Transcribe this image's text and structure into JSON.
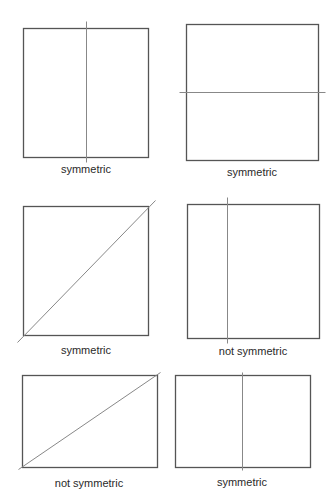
{
  "figures": [
    {
      "id": "fig-1",
      "shape": "square",
      "rect": {
        "x": 23,
        "y": 28,
        "w": 125,
        "h": 129
      },
      "line": {
        "type": "vertical",
        "x1": 86,
        "y1": 21,
        "x2": 86,
        "y2": 162
      },
      "label": "symmetric",
      "label_pos": {
        "x": 86,
        "y": 163
      }
    },
    {
      "id": "fig-2",
      "shape": "square",
      "rect": {
        "x": 186,
        "y": 24,
        "w": 132,
        "h": 136
      },
      "line": {
        "type": "horizontal",
        "x1": 179,
        "y1": 92,
        "x2": 325,
        "y2": 92
      },
      "label": "symmetric",
      "label_pos": {
        "x": 252,
        "y": 166
      }
    },
    {
      "id": "fig-3",
      "shape": "square",
      "rect": {
        "x": 23,
        "y": 206,
        "w": 125,
        "h": 129
      },
      "line": {
        "type": "diagonal",
        "x1": 17,
        "y1": 342,
        "x2": 155,
        "y2": 200
      },
      "label": "symmetric",
      "label_pos": {
        "x": 86,
        "y": 344
      }
    },
    {
      "id": "fig-4",
      "shape": "square",
      "rect": {
        "x": 187,
        "y": 204,
        "w": 132,
        "h": 134
      },
      "line": {
        "type": "vertical",
        "x1": 227,
        "y1": 197,
        "x2": 227,
        "y2": 343
      },
      "label": "not symmetric",
      "label_pos": {
        "x": 253,
        "y": 345
      }
    },
    {
      "id": "fig-5",
      "shape": "rectangle",
      "rect": {
        "x": 22,
        "y": 375,
        "w": 135,
        "h": 92
      },
      "line": {
        "type": "diagonal",
        "x1": 18,
        "y1": 469,
        "x2": 160,
        "y2": 372
      },
      "label": "not symmetric",
      "label_pos": {
        "x": 89,
        "y": 477
      }
    },
    {
      "id": "fig-6",
      "shape": "rectangle",
      "rect": {
        "x": 175,
        "y": 375,
        "w": 135,
        "h": 92
      },
      "line": {
        "type": "vertical",
        "x1": 242,
        "y1": 372,
        "x2": 242,
        "y2": 470
      },
      "label": "symmetric",
      "label_pos": {
        "x": 242,
        "y": 476
      }
    }
  ],
  "colors": {
    "box_stroke": "#555555",
    "line_stroke": "#888888",
    "text": "#2a2a2a"
  }
}
